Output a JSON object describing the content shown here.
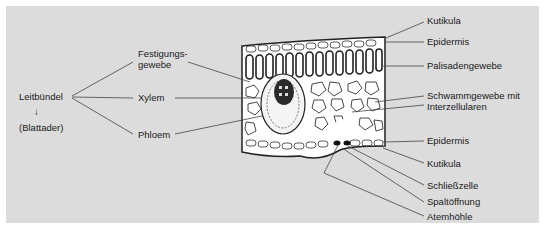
{
  "diagram": {
    "type": "leaf-cross-section",
    "colors": {
      "background": "#dcdcdc",
      "border": "#ffffff",
      "line": "#333333",
      "text": "#1a1a1a"
    }
  },
  "left": {
    "main_label": "Leitbündel",
    "arrow": "↓",
    "sub_label": "(Blattader)",
    "branches": [
      "Festigungs-",
      "gewebe",
      "Xylem",
      "Phloem"
    ]
  },
  "right": {
    "labels": [
      "Kutikula",
      "Epidermis",
      "Palisadengewebe",
      "Schwammgewebe mit",
      "Interzellularen",
      "Epidermis",
      "Kutikula",
      "Schließzelle",
      "Spaltöffnung",
      "Atemhöhle"
    ]
  }
}
